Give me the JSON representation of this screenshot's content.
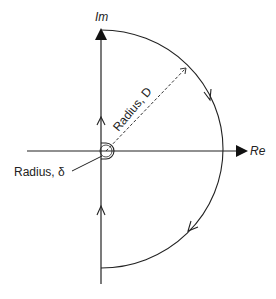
{
  "diagram": {
    "type": "Nyquist contour",
    "axes": {
      "imaginary_label": "Im",
      "real_label": "Re"
    },
    "annotations": {
      "large_radius": "Radius, D",
      "small_radius": "Radius, δ"
    },
    "colors": {
      "line": "#222222",
      "background": "#ffffff"
    }
  }
}
